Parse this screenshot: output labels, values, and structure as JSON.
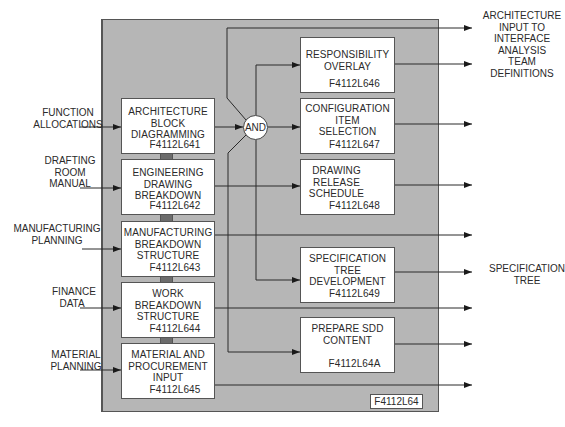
{
  "diagram": {
    "parent_function": {
      "code": "F4112L64"
    },
    "inputs": [
      {
        "label": "FUNCTION\nALLOCATIONS"
      },
      {
        "label": "DRAFTING\nROOM\nMANUAL"
      },
      {
        "label": "MANUFACTURING\nPLANNING"
      },
      {
        "label": "FINANCE\nDATA"
      },
      {
        "label": "MATERIAL\nPLANNING"
      }
    ],
    "left_functions": [
      {
        "title": "ARCHITECTURE\nBLOCK\nDIAGRAMMING",
        "code": "F4112L641"
      },
      {
        "title": "ENGINEERING\nDRAWING\nBREAKDOWN",
        "code": "F4112L642"
      },
      {
        "title": "MANUFACTURING\nBREAKDOWN\nSTRUCTURE",
        "code": "F4112L643"
      },
      {
        "title": "WORK\nBREAKDOWN\nSTRUCTURE",
        "code": "F4112L644"
      },
      {
        "title": "MATERIAL AND\nPROCUREMENT\nINPUT",
        "code": "F4112L645"
      }
    ],
    "and_gate": {
      "label": "AND"
    },
    "right_functions": [
      {
        "title": "RESPONSIBILITY\nOVERLAY",
        "code": "F4112L646"
      },
      {
        "title": "CONFIGURATION\nITEM\nSELECTION",
        "code": "F4112L647"
      },
      {
        "title": "DRAWING\nRELEASE\nSCHEDULE",
        "code": "F4112L648"
      },
      {
        "title": "SPECIFICATION\nTREE\nDEVELOPMENT",
        "code": "F4112L649"
      },
      {
        "title": "PREPARE SDD\nCONTENT",
        "code": "F4112L64A"
      }
    ],
    "outputs": [
      {
        "label": "ARCHITECTURE\nINPUT TO\nINTERFACE\nANALYSIS\nTEAM\nDEFINITIONS"
      },
      {
        "label": "SPECIFICATION\nTREE"
      }
    ],
    "colors": {
      "enclosure_fill": "#b6b6b6",
      "box_fill": "#ffffff",
      "connector_fill": "#6c6c6c",
      "line": "#2a2a2a"
    }
  }
}
